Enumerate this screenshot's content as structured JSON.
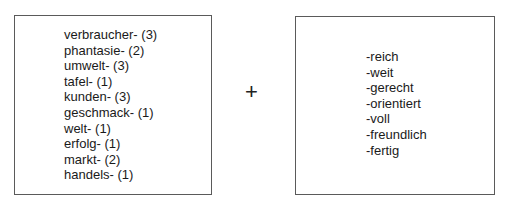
{
  "left_box": {
    "items": [
      "verbraucher- (3)",
      "phantasie- (2)",
      "umwelt- (3)",
      "tafel- (1)",
      "kunden- (3)",
      "geschmack- (1)",
      "welt- (1)",
      "erfolg- (1)",
      "markt- (2)",
      "handels- (1)"
    ]
  },
  "operator": "+",
  "right_box": {
    "items": [
      "-reich",
      "-weit",
      "-gerecht",
      "-orientiert",
      "-voll",
      "-freundlich",
      "-fertig"
    ]
  }
}
